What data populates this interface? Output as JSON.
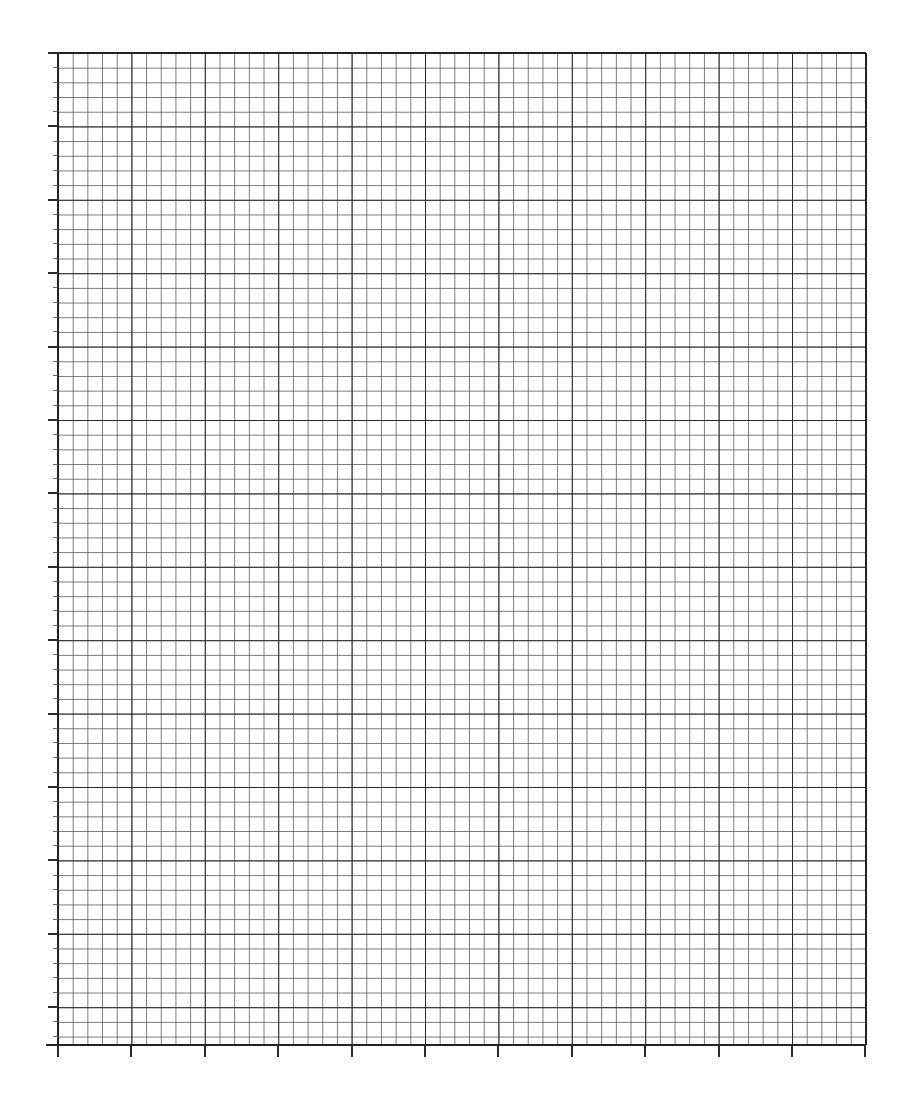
{
  "document": {
    "kind": "graph-paper-sheet",
    "title": "Graph Paper",
    "page_width": 905,
    "page_height": 1100,
    "background_color": "#ffffff"
  },
  "chart_data": {
    "type": "table",
    "title": "",
    "subtitle": "",
    "xlabel": "",
    "ylabel": "",
    "annotations": [],
    "legend": [],
    "legend_position": "none",
    "series": [],
    "categories": [],
    "values": [],
    "grid": {
      "visible": true,
      "style": "engineering-graph-paper",
      "plot_left": 58,
      "plot_top": 53,
      "plot_right": 866,
      "plot_bottom": 1045,
      "plot_width": 808,
      "plot_height": 992,
      "minor_cell_px": 14.68,
      "minor_cells_per_major": 5,
      "major_cell_px": 73.4,
      "major_columns": 11,
      "major_rows": 13.5,
      "minor_columns": 55,
      "minor_rows": 67.6,
      "minor_line_color": "#585858",
      "minor_line_width_px": 0.8,
      "major_line_color": "#2b2b2b",
      "major_line_width_px": 1.9,
      "border_line_color": "#222222",
      "border_line_width_px": 2.1,
      "tick_color": "#2b2b2b",
      "left_major_tick_length_px": 10,
      "left_minor_tick_length_px": 5,
      "bottom_major_tick_length_px": 12,
      "top_edge_tick_length_px": 7,
      "axes_ticks_sides": [
        "left",
        "bottom"
      ]
    },
    "xlim": [
      0,
      55
    ],
    "ylim": [
      0,
      67.6
    ],
    "x_tick_labels": [],
    "y_tick_labels": []
  }
}
